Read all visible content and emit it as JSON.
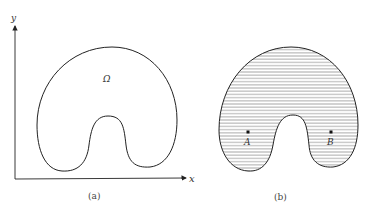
{
  "panels": [
    {
      "id": "a",
      "caption": "(a)",
      "axes": {
        "x_label": "x",
        "y_label": "y"
      },
      "region_label": "Ω",
      "fill": "none"
    },
    {
      "id": "b",
      "caption": "(b)",
      "fill": "horizontal-hatching",
      "points": [
        {
          "label": "A"
        },
        {
          "label": "B"
        }
      ]
    }
  ],
  "colors": {
    "stroke": "#222222",
    "hatch": "#555555",
    "background": "#ffffff"
  }
}
